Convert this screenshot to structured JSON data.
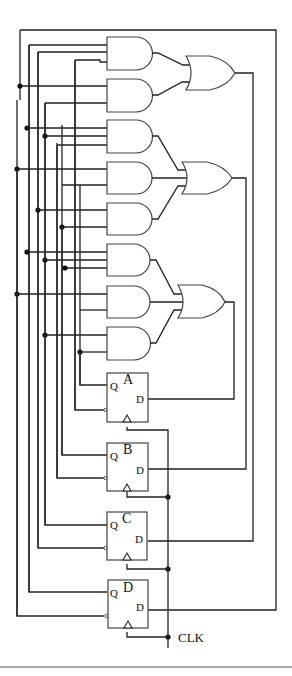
{
  "diagram": {
    "type": "sequential-logic-circuit",
    "flip_flops": [
      {
        "name": "A",
        "q_label": "Q",
        "d_label": "D"
      },
      {
        "name": "B",
        "q_label": "Q",
        "d_label": "D"
      },
      {
        "name": "C",
        "q_label": "Q",
        "d_label": "D"
      },
      {
        "name": "D",
        "q_label": "Q",
        "d_label": "D"
      }
    ],
    "and_gate_count": 8,
    "or_gate_count": 3,
    "clock_label": "CLK"
  }
}
